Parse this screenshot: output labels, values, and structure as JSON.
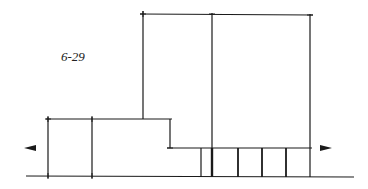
{
  "figure": {
    "label": "6-29",
    "line_color": "#1a1a1a",
    "arrows": {
      "left": "arrow-left",
      "right": "arrow-right"
    }
  }
}
